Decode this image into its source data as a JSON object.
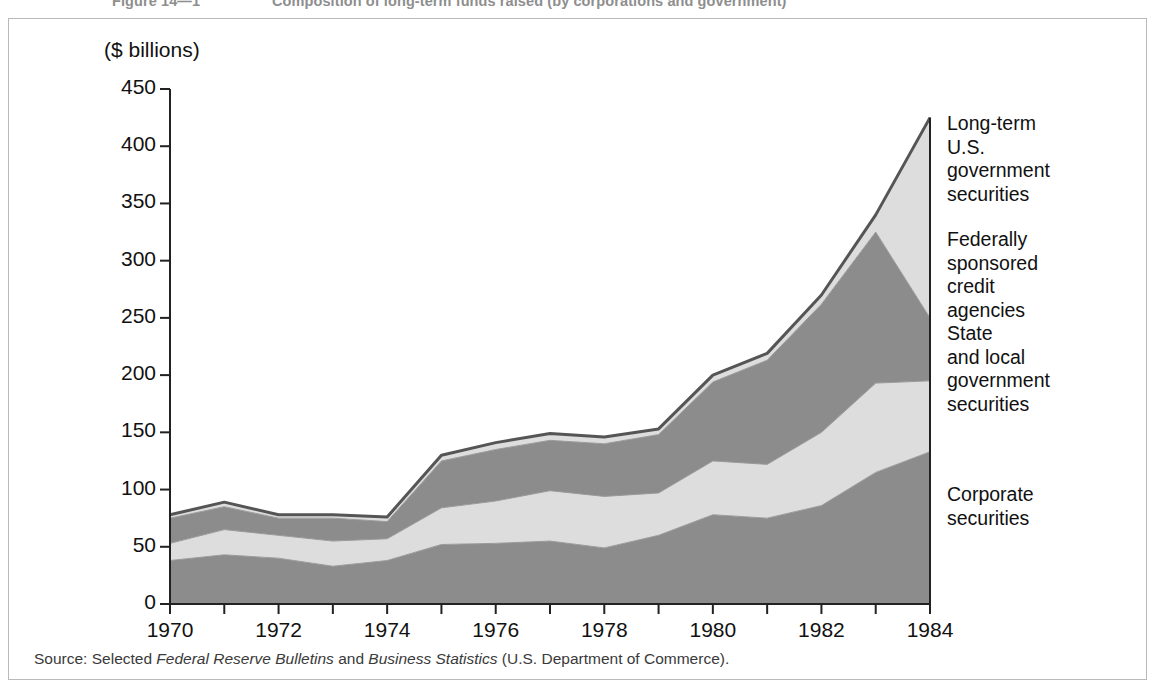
{
  "figure": {
    "number": "Figure 14—1",
    "caption": "Composition of long-term funds raised (by corporations and government)"
  },
  "source_note": {
    "prefix": "Source: Selected ",
    "italic_1": "Federal Reserve Bulletins",
    "middle": " and ",
    "italic_2": "Business Statistics",
    "suffix": " (U.S. Department of Commerce)."
  },
  "series_labels": [
    {
      "key": "us_government",
      "text": "Long-term\nU.S.\ngovernment\nsecurities",
      "top": 112,
      "left": 947
    },
    {
      "key": "federal_agencies",
      "text": "Federally\nsponsored\ncredit\nagencies",
      "top": 228,
      "left": 947
    },
    {
      "key": "state_local",
      "text": "State\nand  local\ngovernment\nsecurities",
      "top": 322,
      "left": 947
    },
    {
      "key": "corporate",
      "text": "Corporate\nsecurities",
      "top": 483,
      "left": 947
    }
  ],
  "colors": {
    "corporate": "#8c8c8c",
    "state_local": "#dddddd",
    "federal_agencies": "#8c8c8c",
    "us_government": "#dddddd",
    "outline": "#555555",
    "axis": "#222222",
    "panel_border": "#b9b9b9",
    "title_text": "#8e8e8e"
  },
  "chart_data": {
    "type": "area",
    "stacked": true,
    "title": "Composition of long-term funds raised (by corporations and government)",
    "xlabel": "",
    "ylabel": "($ billions)",
    "ylim": [
      0,
      450
    ],
    "xlim": [
      1970,
      1984
    ],
    "yticks": [
      0,
      50,
      100,
      150,
      200,
      250,
      300,
      350,
      400,
      450
    ],
    "xticks": [
      1970,
      1971,
      1972,
      1973,
      1974,
      1975,
      1976,
      1977,
      1978,
      1979,
      1980,
      1981,
      1982,
      1983,
      1984
    ],
    "xtick_labels": [
      "1970",
      "",
      "1972",
      "",
      "1974",
      "",
      "1976",
      "",
      "1978",
      "",
      "1980",
      "",
      "1982",
      "",
      "1984"
    ],
    "grid": false,
    "legend_position": "right-inline",
    "x": [
      1970,
      1971,
      1972,
      1973,
      1974,
      1975,
      1976,
      1977,
      1978,
      1979,
      1980,
      1981,
      1982,
      1983,
      1984
    ],
    "series": [
      {
        "name": "Corporate securities",
        "color": "#8c8c8c",
        "values": [
          38,
          43,
          40,
          33,
          38,
          52,
          53,
          55,
          49,
          60,
          78,
          75,
          86,
          115,
          133
        ]
      },
      {
        "name": "State and local government securities",
        "color": "#dddddd",
        "values": [
          15,
          22,
          20,
          22,
          19,
          32,
          37,
          44,
          45,
          37,
          47,
          47,
          64,
          78,
          62
        ]
      },
      {
        "name": "Federally sponsored credit agencies",
        "color": "#8c8c8c",
        "values": [
          22,
          20,
          15,
          20,
          15,
          41,
          45,
          44,
          46,
          51,
          69,
          91,
          112,
          132,
          55
        ]
      },
      {
        "name": "Long-term U.S. government securities",
        "color": "#dddddd",
        "values": [
          3,
          4,
          3,
          3,
          4,
          5,
          6,
          6,
          6,
          5,
          6,
          6,
          8,
          15,
          175
        ]
      }
    ],
    "cumulative": {
      "corporate": [
        38,
        43,
        40,
        33,
        38,
        52,
        53,
        55,
        49,
        60,
        78,
        75,
        86,
        115,
        133
      ],
      "state_local": [
        53,
        65,
        60,
        55,
        57,
        84,
        90,
        99,
        94,
        97,
        125,
        122,
        150,
        193,
        195
      ],
      "federal_agencies": [
        75,
        85,
        75,
        75,
        72,
        125,
        135,
        143,
        140,
        148,
        194,
        213,
        262,
        325,
        250
      ],
      "total": [
        78,
        89,
        78,
        78,
        76,
        130,
        141,
        149,
        146,
        153,
        200,
        219,
        270,
        340,
        425
      ]
    }
  },
  "geometry": {
    "plot_left": 170,
    "plot_right": 930,
    "plot_top": 89,
    "plot_bottom": 604
  }
}
